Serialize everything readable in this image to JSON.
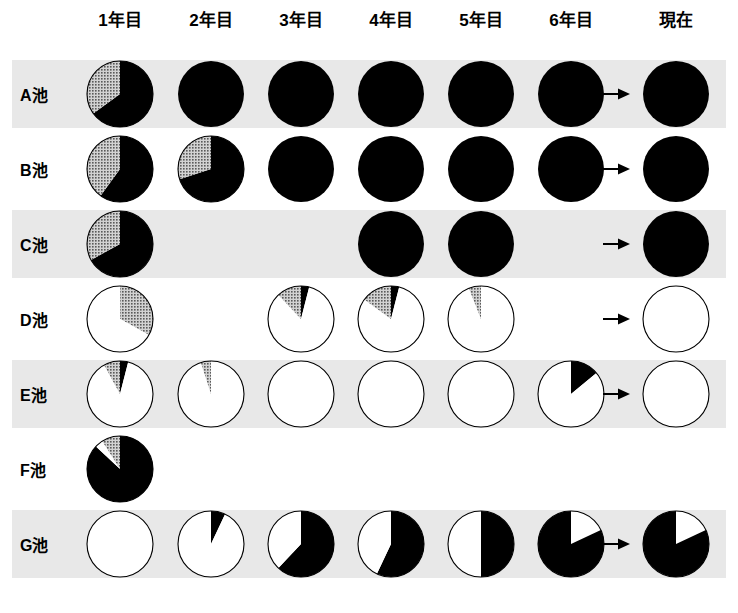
{
  "columns": {
    "headers": [
      {
        "id": "year1",
        "label": "1年目",
        "x": 120
      },
      {
        "id": "year2",
        "label": "2年目",
        "x": 211
      },
      {
        "id": "year3",
        "label": "3年目",
        "x": 301
      },
      {
        "id": "year4",
        "label": "4年目",
        "x": 391
      },
      {
        "id": "year5",
        "label": "5年目",
        "x": 481
      },
      {
        "id": "year6",
        "label": "6年目",
        "x": 571
      },
      {
        "id": "now",
        "label": "現在",
        "x": 676
      }
    ],
    "arrow_x": 617,
    "arrow_icon": "right-arrow-icon"
  },
  "colors": {
    "black": "#000000",
    "gray": "#9a9a9a",
    "white": "#ffffff",
    "outline": "#000000",
    "band_shaded": "#e8e8e8",
    "band_plain": "#ffffff",
    "page_background": "#ffffff"
  },
  "legend_note": "black = 黒 segment, gray = 灰 segment, white = 白 segment",
  "chart_data": {
    "type": "pie",
    "title": "",
    "xlabel": "",
    "ylabel": "",
    "series_names": [
      "black",
      "gray",
      "white"
    ],
    "categories": [
      "1年目",
      "2年目",
      "3年目",
      "4年目",
      "5年目",
      "6年目",
      "現在"
    ],
    "rows": [
      {
        "id": "pond-a",
        "label": "A池",
        "band": "shaded",
        "has_arrow": true,
        "cells": [
          {
            "column": "1年目",
            "present": true,
            "segments": [
              {
                "name": "black",
                "value": 65
              },
              {
                "name": "gray",
                "value": 35
              }
            ]
          },
          {
            "column": "2年目",
            "present": true,
            "segments": [
              {
                "name": "black",
                "value": 100
              }
            ]
          },
          {
            "column": "3年目",
            "present": true,
            "segments": [
              {
                "name": "black",
                "value": 100
              }
            ]
          },
          {
            "column": "4年目",
            "present": true,
            "segments": [
              {
                "name": "black",
                "value": 100
              }
            ]
          },
          {
            "column": "5年目",
            "present": true,
            "segments": [
              {
                "name": "black",
                "value": 100
              }
            ]
          },
          {
            "column": "6年目",
            "present": true,
            "segments": [
              {
                "name": "black",
                "value": 100
              }
            ]
          },
          {
            "column": "現在",
            "present": true,
            "segments": [
              {
                "name": "black",
                "value": 100
              }
            ]
          }
        ]
      },
      {
        "id": "pond-b",
        "label": "B池",
        "band": "plain",
        "has_arrow": true,
        "cells": [
          {
            "column": "1年目",
            "present": true,
            "segments": [
              {
                "name": "black",
                "value": 60
              },
              {
                "name": "gray",
                "value": 40
              }
            ]
          },
          {
            "column": "2年目",
            "present": true,
            "segments": [
              {
                "name": "black",
                "value": 70
              },
              {
                "name": "gray",
                "value": 30
              }
            ]
          },
          {
            "column": "3年目",
            "present": true,
            "segments": [
              {
                "name": "black",
                "value": 100
              }
            ]
          },
          {
            "column": "4年目",
            "present": true,
            "segments": [
              {
                "name": "black",
                "value": 100
              }
            ]
          },
          {
            "column": "5年目",
            "present": true,
            "segments": [
              {
                "name": "black",
                "value": 100
              }
            ]
          },
          {
            "column": "6年目",
            "present": true,
            "segments": [
              {
                "name": "black",
                "value": 100
              }
            ]
          },
          {
            "column": "現在",
            "present": true,
            "segments": [
              {
                "name": "black",
                "value": 100
              }
            ]
          }
        ]
      },
      {
        "id": "pond-c",
        "label": "C池",
        "band": "shaded",
        "has_arrow": true,
        "cells": [
          {
            "column": "1年目",
            "present": true,
            "segments": [
              {
                "name": "black",
                "value": 67
              },
              {
                "name": "gray",
                "value": 33
              }
            ]
          },
          {
            "column": "2年目",
            "present": false,
            "segments": []
          },
          {
            "column": "3年目",
            "present": false,
            "segments": []
          },
          {
            "column": "4年目",
            "present": true,
            "segments": [
              {
                "name": "black",
                "value": 100
              }
            ]
          },
          {
            "column": "5年目",
            "present": true,
            "segments": [
              {
                "name": "black",
                "value": 100
              }
            ]
          },
          {
            "column": "6年目",
            "present": false,
            "segments": []
          },
          {
            "column": "現在",
            "present": true,
            "segments": [
              {
                "name": "black",
                "value": 100
              }
            ]
          }
        ]
      },
      {
        "id": "pond-d",
        "label": "D池",
        "band": "plain",
        "has_arrow": true,
        "cells": [
          {
            "column": "1年目",
            "present": true,
            "segments": [
              {
                "name": "gray",
                "value": 33
              },
              {
                "name": "white",
                "value": 67
              }
            ],
            "start": -90
          },
          {
            "column": "2年目",
            "present": false,
            "segments": []
          },
          {
            "column": "3年目",
            "present": true,
            "segments": [
              {
                "name": "black",
                "value": 4
              },
              {
                "name": "white",
                "value": 84
              },
              {
                "name": "gray",
                "value": 12
              }
            ],
            "start": -90
          },
          {
            "column": "4年目",
            "present": true,
            "segments": [
              {
                "name": "black",
                "value": 4
              },
              {
                "name": "white",
                "value": 81
              },
              {
                "name": "gray",
                "value": 15
              }
            ],
            "start": -90
          },
          {
            "column": "5年目",
            "present": true,
            "segments": [
              {
                "name": "white",
                "value": 94
              },
              {
                "name": "gray",
                "value": 6
              }
            ],
            "start": -90
          },
          {
            "column": "6年目",
            "present": false,
            "segments": []
          },
          {
            "column": "現在",
            "present": true,
            "segments": [
              {
                "name": "white",
                "value": 100
              }
            ]
          }
        ]
      },
      {
        "id": "pond-e",
        "label": "E池",
        "band": "shaded",
        "has_arrow": true,
        "cells": [
          {
            "column": "1年目",
            "present": true,
            "segments": [
              {
                "name": "black",
                "value": 4
              },
              {
                "name": "white",
                "value": 88
              },
              {
                "name": "gray",
                "value": 8
              }
            ],
            "start": -90
          },
          {
            "column": "2年目",
            "present": true,
            "segments": [
              {
                "name": "white",
                "value": 95
              },
              {
                "name": "gray",
                "value": 5
              }
            ],
            "start": -90
          },
          {
            "column": "3年目",
            "present": true,
            "segments": [
              {
                "name": "white",
                "value": 100
              }
            ]
          },
          {
            "column": "4年目",
            "present": true,
            "segments": [
              {
                "name": "white",
                "value": 100
              }
            ]
          },
          {
            "column": "5年目",
            "present": true,
            "segments": [
              {
                "name": "white",
                "value": 100
              }
            ]
          },
          {
            "column": "6年目",
            "present": true,
            "segments": [
              {
                "name": "black",
                "value": 14
              },
              {
                "name": "white",
                "value": 86
              }
            ],
            "start": -90
          },
          {
            "column": "現在",
            "present": true,
            "segments": [
              {
                "name": "white",
                "value": 100
              }
            ]
          }
        ]
      },
      {
        "id": "pond-f",
        "label": "F池",
        "band": "plain",
        "has_arrow": false,
        "cells": [
          {
            "column": "1年目",
            "present": true,
            "segments": [
              {
                "name": "black",
                "value": 87
              },
              {
                "name": "white",
                "value": 4
              },
              {
                "name": "gray",
                "value": 9
              }
            ],
            "start": -90
          },
          {
            "column": "2年目",
            "present": false,
            "segments": []
          },
          {
            "column": "3年目",
            "present": false,
            "segments": []
          },
          {
            "column": "4年目",
            "present": false,
            "segments": []
          },
          {
            "column": "5年目",
            "present": false,
            "segments": []
          },
          {
            "column": "6年目",
            "present": false,
            "segments": []
          },
          {
            "column": "現在",
            "present": false,
            "segments": []
          }
        ]
      },
      {
        "id": "pond-g",
        "label": "G池",
        "band": "shaded",
        "has_arrow": true,
        "cells": [
          {
            "column": "1年目",
            "present": true,
            "segments": [
              {
                "name": "white",
                "value": 100
              }
            ]
          },
          {
            "column": "2年目",
            "present": true,
            "segments": [
              {
                "name": "black",
                "value": 7
              },
              {
                "name": "white",
                "value": 93
              }
            ],
            "start": -90
          },
          {
            "column": "3年目",
            "present": true,
            "segments": [
              {
                "name": "black",
                "value": 62
              },
              {
                "name": "white",
                "value": 38
              }
            ],
            "start": -90
          },
          {
            "column": "4年目",
            "present": true,
            "segments": [
              {
                "name": "black",
                "value": 57
              },
              {
                "name": "white",
                "value": 43
              }
            ],
            "start": -90
          },
          {
            "column": "5年目",
            "present": true,
            "segments": [
              {
                "name": "black",
                "value": 50
              },
              {
                "name": "white",
                "value": 50
              }
            ],
            "start": -90
          },
          {
            "column": "6年目",
            "present": true,
            "segments": [
              {
                "name": "white",
                "value": 18
              },
              {
                "name": "black",
                "value": 82
              }
            ],
            "start": -90
          },
          {
            "column": "現在",
            "present": true,
            "segments": [
              {
                "name": "white",
                "value": 18
              },
              {
                "name": "black",
                "value": 82
              }
            ],
            "start": -90
          }
        ]
      }
    ]
  },
  "layout": {
    "row_top_start": 60,
    "row_height": 68,
    "row_gap": 7,
    "pie_diameter": 66
  }
}
